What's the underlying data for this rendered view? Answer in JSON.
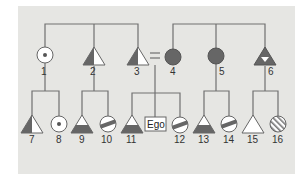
{
  "diagram": {
    "type": "kinship-chart",
    "ego_label": "Ego",
    "marriage_symbol": "=",
    "colors": {
      "background": "#e6e6e3",
      "line": "#707070",
      "fill_dark": "#666666",
      "fill_light": "#ffffff",
      "stripe": "#666666"
    },
    "generation1": [
      {
        "id": "1",
        "shape": "circle",
        "pattern": "dot"
      },
      {
        "id": "2",
        "shape": "triangle",
        "pattern": "left-half-dark"
      },
      {
        "id": "3",
        "shape": "triangle",
        "pattern": "left-half-dark"
      },
      {
        "id": "4",
        "shape": "circle",
        "pattern": "solid-dark"
      },
      {
        "id": "5",
        "shape": "circle",
        "pattern": "solid-dark"
      },
      {
        "id": "6",
        "shape": "triangle",
        "pattern": "dark-with-inverted-white-triangle"
      }
    ],
    "generation2": [
      {
        "id": "7",
        "shape": "triangle",
        "pattern": "left-half-dark"
      },
      {
        "id": "8",
        "shape": "circle",
        "pattern": "dot"
      },
      {
        "id": "9",
        "shape": "triangle",
        "pattern": "bottom-half-dark"
      },
      {
        "id": "10",
        "shape": "circle",
        "pattern": "diagonal-band"
      },
      {
        "id": "11",
        "shape": "triangle",
        "pattern": "bottom-half-dark"
      },
      {
        "id": "ego",
        "shape": "box",
        "pattern": "label"
      },
      {
        "id": "12",
        "shape": "circle",
        "pattern": "diagonal-band"
      },
      {
        "id": "13",
        "shape": "triangle",
        "pattern": "bottom-half-dark"
      },
      {
        "id": "14",
        "shape": "circle",
        "pattern": "diagonal-band"
      },
      {
        "id": "15",
        "shape": "triangle",
        "pattern": "empty"
      },
      {
        "id": "16",
        "shape": "circle",
        "pattern": "hatched"
      }
    ],
    "labels": {
      "n1": "1",
      "n2": "2",
      "n3": "3",
      "n4": "4",
      "n5": "5",
      "n6": "6",
      "n7": "7",
      "n8": "8",
      "n9": "9",
      "n10": "10",
      "n11": "11",
      "n12": "12",
      "n13": "13",
      "n14": "14",
      "n15": "15",
      "n16": "16"
    }
  }
}
